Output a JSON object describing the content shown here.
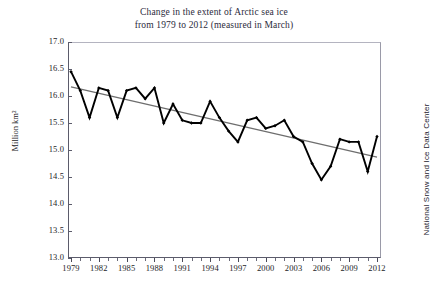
{
  "chart_data": {
    "type": "line",
    "title": "Change in the extent of Arctic sea ice from 1979 to 2012 (measured in March)",
    "title_line1": "Change in the extent of Arctic sea ice",
    "title_line2": "from 1979 to 2012 (measured in March)",
    "xlabel": "",
    "ylabel": "Million km²",
    "ylim": [
      13.0,
      17.0
    ],
    "xlim": [
      1979,
      2012
    ],
    "grid": false,
    "legend": "none",
    "source_credit": "National  Snow and Ice Data Center",
    "ytick_labels": [
      "17.0",
      "16.5",
      "16.0",
      "15.5",
      "15.0",
      "14.5",
      "14.0",
      "13.5",
      "13.0"
    ],
    "ytick_values": [
      17.0,
      16.5,
      16.0,
      15.5,
      15.0,
      14.5,
      14.0,
      13.5,
      13.0
    ],
    "xtick_labels": [
      "1979",
      "1982",
      "1985",
      "1988",
      "1991",
      "1994",
      "1997",
      "2000",
      "2003",
      "2006",
      "2009",
      "2012"
    ],
    "xtick_values": [
      1979,
      1982,
      1985,
      1988,
      1991,
      1994,
      1997,
      2000,
      2003,
      2006,
      2009,
      2012
    ],
    "x": [
      1979,
      1980,
      1981,
      1982,
      1983,
      1984,
      1985,
      1986,
      1987,
      1988,
      1989,
      1990,
      1991,
      1992,
      1993,
      1994,
      1995,
      1996,
      1997,
      1998,
      1999,
      2000,
      2001,
      2002,
      2003,
      2004,
      2005,
      2006,
      2007,
      2008,
      2009,
      2010,
      2011,
      2012
    ],
    "series": [
      {
        "name": "Arctic sea ice extent (March)",
        "color": "#000000",
        "marker": "filled-diamond",
        "values": [
          16.45,
          16.1,
          15.6,
          16.15,
          16.1,
          15.6,
          16.1,
          16.15,
          15.95,
          16.15,
          15.5,
          15.85,
          15.55,
          15.5,
          15.5,
          15.9,
          15.6,
          15.35,
          15.15,
          15.55,
          15.6,
          15.4,
          15.45,
          15.55,
          15.25,
          15.15,
          14.75,
          14.45,
          14.7,
          15.2,
          15.15,
          15.15,
          14.6,
          15.25
        ]
      }
    ],
    "trendline": {
      "name": "Linear trend",
      "color": "#6e6e6e",
      "x_start": 1979,
      "x_end": 2012,
      "y_start": 16.17,
      "y_end": 14.87
    }
  }
}
